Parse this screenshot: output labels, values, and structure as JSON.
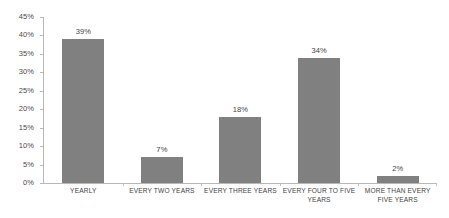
{
  "chart_data": {
    "type": "bar",
    "title": "",
    "subtitle": "",
    "xlabel": "",
    "ylabel": "",
    "categories": [
      "YEARLY",
      "EVERY TWO YEARS",
      "EVERY THREE YEARS",
      "EVERY FOUR TO FIVE YEARS",
      "MORE THAN EVERY FIVE YEARS"
    ],
    "values": [
      39,
      7,
      18,
      34,
      2
    ],
    "data_labels": [
      "39%",
      "7%",
      "18%",
      "34%",
      "2%"
    ],
    "ylim": [
      0,
      45
    ],
    "ytick_values": [
      0,
      5,
      10,
      15,
      20,
      25,
      30,
      35,
      40,
      45
    ],
    "ytick_labels": [
      "0%",
      "5%",
      "10%",
      "15%",
      "20%",
      "25%",
      "30%",
      "35%",
      "40%",
      "45%"
    ],
    "grid": false,
    "legend": false,
    "legend_position": "none",
    "bar_color": "#808080",
    "axis_color": "#b8b8b8",
    "text_color": "#3f3f3f",
    "background_color": "#ffffff"
  }
}
